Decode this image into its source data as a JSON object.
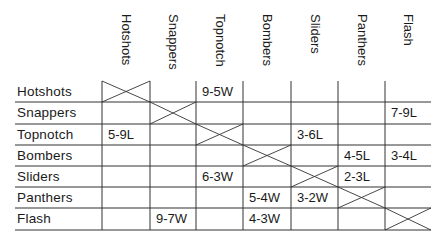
{
  "table": {
    "columns": [
      "Hotshots",
      "Snappers",
      "Topnotch",
      "Bombers",
      "Sliders",
      "Panthers",
      "Flash"
    ],
    "rows": [
      {
        "team": "Hotshots",
        "cells": [
          "X",
          "",
          "9-5W",
          "",
          "",
          "",
          ""
        ]
      },
      {
        "team": "Snappers",
        "cells": [
          "",
          "X",
          "",
          "",
          "",
          "",
          "7-9L"
        ]
      },
      {
        "team": "Topnotch",
        "cells": [
          "5-9L",
          "",
          "X",
          "",
          "3-6L",
          "",
          ""
        ]
      },
      {
        "team": "Bombers",
        "cells": [
          "",
          "",
          "",
          "X",
          "",
          "4-5L",
          "3-4L"
        ]
      },
      {
        "team": "Sliders",
        "cells": [
          "",
          "",
          "6-3W",
          "",
          "X",
          "2-3L",
          ""
        ]
      },
      {
        "team": "Panthers",
        "cells": [
          "",
          "",
          "",
          "5-4W",
          "3-2W",
          "X",
          ""
        ]
      },
      {
        "team": "Flash",
        "cells": [
          "",
          "9-7W",
          "",
          "4-3W",
          "",
          "",
          "X"
        ]
      }
    ]
  },
  "colors": {
    "line": "#333333",
    "text": "#1a1a1a",
    "background": "#ffffff"
  }
}
